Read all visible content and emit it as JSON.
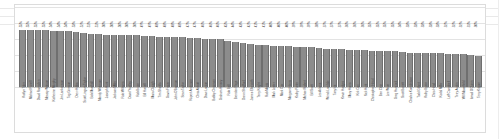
{
  "chart_data": {
    "type": "bar",
    "title": "",
    "xlabel": "",
    "ylabel": "",
    "ylim": [
      0,
      60
    ],
    "grid": true,
    "legend": "none",
    "value_label_suffix": "%",
    "bar_color": "#8c8c8c",
    "gridline_color": "#e3e3e3",
    "categories": [
      "Kaitlyn Tyler",
      "Michael Farrell",
      "David Ramsden",
      "Mearsy Watson",
      "Katherine Murphy",
      "Jim Lankowson",
      "Tag Grimson",
      "Drew Hibbs",
      "Scott Lingam-Taylor",
      "Bob Marshall",
      "Mandy Whitmore",
      "Joseph Hunt",
      "Jackson Miller",
      "Rob Williams",
      "David Yardley",
      "Rob Bruce",
      "Bill Howell",
      "Maria Clough",
      "Tim Shields",
      "Gavin Fraser",
      "John O'Bannon",
      "Sean Taylor",
      "Rupert Anderson",
      "Chris Abbott",
      "Dave Larson",
      "Bobby Chrisman",
      "Graham Hersey",
      "Rob Bell",
      "Brendan Page",
      "Dawn Shadford",
      "James Ellsworth",
      "Terry Knight",
      "Rob Morris",
      "Mark Lester",
      "Mark Cox",
      "Margaret Harris",
      "Kathy Porter",
      "Michael Robert",
      "Bill Scott",
      "Les Adams",
      "Wendi Landale",
      "Tony Iris",
      "Kevin Hodges",
      "Mary Harris",
      "Kirk Cox",
      "Nick Hunt",
      "Christopher Head",
      "Ben Cline",
      "Lee Ware",
      "Greg Hancock",
      "Scott Barrett",
      "Charles Komderson",
      "Todd Gilbert",
      "Kathy Byron",
      "Chris Head",
      "Kodal Miller",
      "Leff Campbell",
      "Terry Austin",
      "Will Moorefield",
      "Ismail O'Quinn",
      "Terry Kilgore"
    ],
    "values": [
      55,
      55,
      55,
      55,
      54,
      54,
      54,
      53,
      52,
      51,
      51,
      50,
      50,
      50,
      50,
      50,
      49,
      49,
      48,
      48,
      48,
      48,
      47,
      47,
      46,
      46,
      46,
      45,
      44,
      43,
      42,
      41,
      41,
      40,
      40,
      40,
      39,
      39,
      39,
      38,
      37,
      37,
      37,
      36,
      36,
      36,
      35,
      35,
      35,
      35,
      34,
      33,
      33,
      33,
      33,
      33,
      32,
      32,
      32,
      31,
      30
    ],
    "value_labels": [
      "55%",
      "55%",
      "55%",
      "55%",
      "54%",
      "54%",
      "54%",
      "53%",
      "52%",
      "51%",
      "51%",
      "50%",
      "50%",
      "50%",
      "50%",
      "50%",
      "49%",
      "49%",
      "48%",
      "48%",
      "48%",
      "48%",
      "47%",
      "47%",
      "46%",
      "46%",
      "46%",
      "45%",
      "44%",
      "43%",
      "42%",
      "41%",
      "41%",
      "40%",
      "40%",
      "40%",
      "39%",
      "39%",
      "39%",
      "38%",
      "37%",
      "37%",
      "37%",
      "36%",
      "36%",
      "36%",
      "35%",
      "35%",
      "35%",
      "35%",
      "34%",
      "33%",
      "33%",
      "33%",
      "33%",
      "33%",
      "32%",
      "32%",
      "32%",
      "31%",
      "30%"
    ]
  }
}
